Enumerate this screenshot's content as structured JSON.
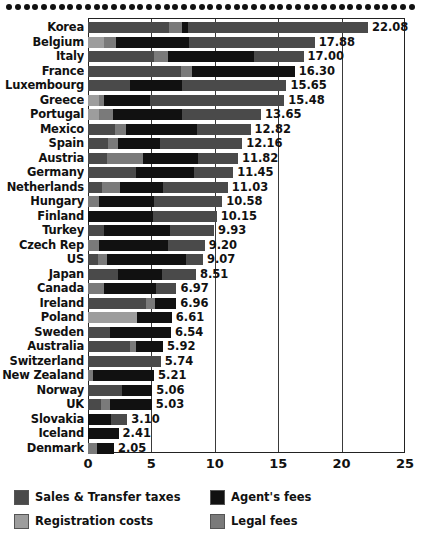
{
  "chart_data": {
    "type": "bar",
    "orientation": "horizontal",
    "stacked": true,
    "title": "",
    "subtitle": "",
    "xlabel": "",
    "ylabel": "",
    "xlim": [
      0,
      25
    ],
    "xticks": [
      "0",
      "5",
      "10",
      "15",
      "20",
      "25"
    ],
    "grid": true,
    "grid_axis": "x",
    "legend_position": "bottom",
    "series": [
      {
        "name": "Sales & Transfer taxes",
        "key": "sales",
        "color": "#4a4a4a"
      },
      {
        "name": "Agent's fees",
        "key": "agent",
        "color": "#111111"
      },
      {
        "name": "Registration costs",
        "key": "registration",
        "color": "#9d9d9d"
      },
      {
        "name": "Legal fees",
        "key": "legal",
        "color": "#7a7a7a"
      }
    ],
    "categories": [
      "Korea",
      "Belgium",
      "Italy",
      "France",
      "Luxembourg",
      "Greece",
      "Portugal",
      "Mexico",
      "Spain",
      "Austria",
      "Germany",
      "Netherlands",
      "Hungary",
      "Finland",
      "Turkey",
      "Czech Rep",
      "US",
      "Japan",
      "Canada",
      "Ireland",
      "Poland",
      "Sweden",
      "Australia",
      "Switzerland",
      "New Zealand",
      "Norway",
      "UK",
      "Slovakia",
      "Iceland",
      "Denmark"
    ],
    "totals": [
      22.08,
      17.88,
      17.0,
      16.3,
      15.65,
      15.48,
      13.65,
      12.82,
      12.16,
      11.82,
      11.45,
      11.03,
      10.58,
      10.15,
      9.93,
      9.2,
      9.07,
      8.51,
      6.97,
      6.96,
      6.61,
      6.54,
      5.92,
      5.74,
      5.21,
      5.06,
      5.03,
      3.1,
      2.41,
      2.05
    ],
    "total_labels": [
      "22.08",
      "17.88",
      "17.00",
      "16.30",
      "15.65",
      "15.48",
      "13.65",
      "12.82",
      "12.16",
      "11.82",
      "11.45",
      "11.03",
      "10.58",
      "10.15",
      "9.93",
      "9.20",
      "9.07",
      "8.51",
      "6.97",
      "6.96",
      "6.61",
      "6.54",
      "5.92",
      "5.74",
      "5.21",
      "5.06",
      "5.03",
      "3.10",
      "2.41",
      "2.05"
    ],
    "rows": [
      {
        "category": "Korea",
        "total": 22.08,
        "label": "22.08",
        "segments": [
          {
            "key": "sales",
            "value": 6.4
          },
          {
            "key": "legal",
            "value": 1.0
          },
          {
            "key": "agent",
            "value": 0.5
          },
          {
            "key": "sales",
            "value": 14.18
          }
        ]
      },
      {
        "category": "Belgium",
        "total": 17.88,
        "label": "17.88",
        "segments": [
          {
            "key": "registration",
            "value": 1.3
          },
          {
            "key": "legal",
            "value": 0.9
          },
          {
            "key": "agent",
            "value": 5.8
          },
          {
            "key": "sales",
            "value": 9.88
          }
        ]
      },
      {
        "category": "Italy",
        "total": 17.0,
        "label": "17.00",
        "segments": [
          {
            "key": "sales",
            "value": 5.2
          },
          {
            "key": "legal",
            "value": 1.1
          },
          {
            "key": "agent",
            "value": 6.8
          },
          {
            "key": "sales",
            "value": 3.9
          }
        ]
      },
      {
        "category": "France",
        "total": 16.3,
        "label": "16.30",
        "segments": [
          {
            "key": "sales",
            "value": 7.3
          },
          {
            "key": "legal",
            "value": 0.9
          },
          {
            "key": "agent",
            "value": 8.1
          }
        ]
      },
      {
        "category": "Luxembourg",
        "total": 15.65,
        "label": "15.65",
        "segments": [
          {
            "key": "sales",
            "value": 3.3
          },
          {
            "key": "agent",
            "value": 4.1
          },
          {
            "key": "sales",
            "value": 8.25
          }
        ]
      },
      {
        "category": "Greece",
        "total": 15.48,
        "label": "15.48",
        "segments": [
          {
            "key": "registration",
            "value": 0.9
          },
          {
            "key": "legal",
            "value": 0.4
          },
          {
            "key": "agent",
            "value": 3.6
          },
          {
            "key": "sales",
            "value": 10.58
          }
        ]
      },
      {
        "category": "Portugal",
        "total": 13.65,
        "label": "13.65",
        "segments": [
          {
            "key": "registration",
            "value": 0.9
          },
          {
            "key": "legal",
            "value": 1.1
          },
          {
            "key": "agent",
            "value": 5.4
          },
          {
            "key": "sales",
            "value": 6.25
          }
        ]
      },
      {
        "category": "Mexico",
        "total": 12.82,
        "label": "12.82",
        "segments": [
          {
            "key": "sales",
            "value": 2.1
          },
          {
            "key": "legal",
            "value": 0.9
          },
          {
            "key": "agent",
            "value": 5.6
          },
          {
            "key": "sales",
            "value": 4.22
          }
        ]
      },
      {
        "category": "Spain",
        "total": 12.16,
        "label": "12.16",
        "segments": [
          {
            "key": "sales",
            "value": 1.6
          },
          {
            "key": "legal",
            "value": 0.8
          },
          {
            "key": "agent",
            "value": 3.3
          },
          {
            "key": "sales",
            "value": 6.46
          }
        ]
      },
      {
        "category": "Austria",
        "total": 11.82,
        "label": "11.82",
        "segments": [
          {
            "key": "sales",
            "value": 1.5
          },
          {
            "key": "legal",
            "value": 2.8
          },
          {
            "key": "agent",
            "value": 4.4
          },
          {
            "key": "sales",
            "value": 3.12
          }
        ]
      },
      {
        "category": "Germany",
        "total": 11.45,
        "label": "11.45",
        "segments": [
          {
            "key": "sales",
            "value": 3.8
          },
          {
            "key": "agent",
            "value": 4.6
          },
          {
            "key": "sales",
            "value": 3.05
          }
        ]
      },
      {
        "category": "Netherlands",
        "total": 11.03,
        "label": "11.03",
        "segments": [
          {
            "key": "sales",
            "value": 1.1
          },
          {
            "key": "legal",
            "value": 1.4
          },
          {
            "key": "agent",
            "value": 3.4
          },
          {
            "key": "sales",
            "value": 5.13
          }
        ]
      },
      {
        "category": "Hungary",
        "total": 10.58,
        "label": "10.58",
        "segments": [
          {
            "key": "legal",
            "value": 0.9
          },
          {
            "key": "agent",
            "value": 4.3
          },
          {
            "key": "sales",
            "value": 5.38
          }
        ]
      },
      {
        "category": "Finland",
        "total": 10.15,
        "label": "10.15",
        "segments": [
          {
            "key": "agent",
            "value": 5.1
          },
          {
            "key": "sales",
            "value": 5.05
          }
        ]
      },
      {
        "category": "Turkey",
        "total": 9.93,
        "label": "9.93",
        "segments": [
          {
            "key": "sales",
            "value": 1.3
          },
          {
            "key": "agent",
            "value": 5.2
          },
          {
            "key": "sales",
            "value": 3.43
          }
        ]
      },
      {
        "category": "Czech Rep",
        "total": 9.2,
        "label": "9.20",
        "segments": [
          {
            "key": "legal",
            "value": 0.9
          },
          {
            "key": "agent",
            "value": 5.4
          },
          {
            "key": "sales",
            "value": 2.9
          }
        ]
      },
      {
        "category": "US",
        "total": 9.07,
        "label": "9.07",
        "segments": [
          {
            "key": "sales",
            "value": 0.8
          },
          {
            "key": "legal",
            "value": 0.7
          },
          {
            "key": "agent",
            "value": 6.2
          },
          {
            "key": "sales",
            "value": 1.37
          }
        ]
      },
      {
        "category": "Japan",
        "total": 8.51,
        "label": "8.51",
        "segments": [
          {
            "key": "sales",
            "value": 2.4
          },
          {
            "key": "agent",
            "value": 3.4
          },
          {
            "key": "sales",
            "value": 2.71
          }
        ]
      },
      {
        "category": "Canada",
        "total": 6.97,
        "label": "6.97",
        "segments": [
          {
            "key": "legal",
            "value": 1.3
          },
          {
            "key": "agent",
            "value": 4.1
          },
          {
            "key": "sales",
            "value": 1.57
          }
        ]
      },
      {
        "category": "Ireland",
        "total": 6.96,
        "label": "6.96",
        "segments": [
          {
            "key": "sales",
            "value": 4.6
          },
          {
            "key": "legal",
            "value": 0.7
          },
          {
            "key": "agent",
            "value": 1.66
          }
        ]
      },
      {
        "category": "Poland",
        "total": 6.61,
        "label": "6.61",
        "segments": [
          {
            "key": "registration",
            "value": 3.9
          },
          {
            "key": "agent",
            "value": 2.71
          }
        ]
      },
      {
        "category": "Sweden",
        "total": 6.54,
        "label": "6.54",
        "segments": [
          {
            "key": "sales",
            "value": 1.7
          },
          {
            "key": "agent",
            "value": 4.84
          }
        ]
      },
      {
        "category": "Australia",
        "total": 5.92,
        "label": "5.92",
        "segments": [
          {
            "key": "sales",
            "value": 3.3
          },
          {
            "key": "legal",
            "value": 0.5
          },
          {
            "key": "agent",
            "value": 2.12
          }
        ]
      },
      {
        "category": "Switzerland",
        "total": 5.74,
        "label": "5.74",
        "segments": [
          {
            "key": "sales",
            "value": 5.74
          }
        ]
      },
      {
        "category": "New Zealand",
        "total": 5.21,
        "label": "5.21",
        "segments": [
          {
            "key": "legal",
            "value": 0.4
          },
          {
            "key": "agent",
            "value": 4.81
          }
        ]
      },
      {
        "category": "Norway",
        "total": 5.06,
        "label": "5.06",
        "segments": [
          {
            "key": "sales",
            "value": 2.7
          },
          {
            "key": "agent",
            "value": 2.36
          }
        ]
      },
      {
        "category": "UK",
        "total": 5.03,
        "label": "5.03",
        "segments": [
          {
            "key": "sales",
            "value": 1.0
          },
          {
            "key": "legal",
            "value": 0.7
          },
          {
            "key": "agent",
            "value": 3.33
          }
        ]
      },
      {
        "category": "Slovakia",
        "total": 3.1,
        "label": "3.10",
        "segments": [
          {
            "key": "agent",
            "value": 1.8
          },
          {
            "key": "sales",
            "value": 1.3
          }
        ]
      },
      {
        "category": "Iceland",
        "total": 2.41,
        "label": "2.41",
        "segments": [
          {
            "key": "agent",
            "value": 2.41
          }
        ]
      },
      {
        "category": "Denmark",
        "total": 2.05,
        "label": "2.05",
        "segments": [
          {
            "key": "legal",
            "value": 0.7
          },
          {
            "key": "agent",
            "value": 1.35
          }
        ]
      }
    ]
  },
  "legend": {
    "items": [
      {
        "label": "Sales & Transfer taxes",
        "key": "sales"
      },
      {
        "label": "Agent's fees",
        "key": "agent"
      },
      {
        "label": "Registration costs",
        "key": "registration"
      },
      {
        "label": "Legal fees",
        "key": "legal"
      }
    ]
  }
}
